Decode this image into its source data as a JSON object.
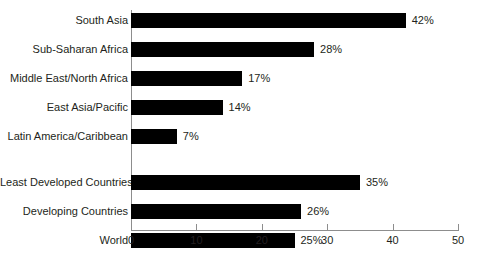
{
  "chart_data": {
    "type": "bar",
    "orientation": "horizontal",
    "title": "",
    "subtitle": "",
    "xlabel": "",
    "ylabel": "",
    "xlim": [
      0,
      50
    ],
    "xticks": [
      0,
      10,
      20,
      30,
      40,
      50
    ],
    "xtick_labels": [
      "0",
      "10",
      "20",
      "30",
      "40",
      "50"
    ],
    "grid": false,
    "legend": false,
    "bar_color": "#000000",
    "axis_color": "#8d8d8d",
    "text_color": "#231f20",
    "background": "#ffffff",
    "value_label_suffix": "%",
    "categories": [
      "South Asia",
      "Sub-Saharan Africa",
      "Middle East/North Africa",
      "East Asia/Pacific",
      "Latin America/Caribbean",
      "Least Developed Countries",
      "Developing Countries",
      "World"
    ],
    "values": [
      42,
      28,
      17,
      14,
      7,
      35,
      26,
      25
    ],
    "value_labels": [
      "42%",
      "28%",
      "17%",
      "14%",
      "7%",
      "35%",
      "26%",
      "25%"
    ],
    "groups": [
      {
        "name": "regions",
        "categories": [
          "South Asia",
          "Sub-Saharan Africa",
          "Middle East/North Africa",
          "East Asia/Pacific",
          "Latin America/Caribbean"
        ],
        "values": [
          42,
          28,
          17,
          14,
          7
        ]
      },
      {
        "name": "aggregates",
        "categories": [
          "Least Developed Countries",
          "Developing Countries",
          "World"
        ],
        "values": [
          35,
          26,
          25
        ]
      }
    ]
  }
}
